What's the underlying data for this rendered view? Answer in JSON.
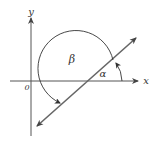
{
  "diagram": {
    "axis_labels": {
      "x": "x",
      "y": "y",
      "origin": "0"
    },
    "angle_labels": {
      "alpha": "α",
      "beta": "β"
    },
    "colors": {
      "axes": "#555555",
      "line": "#666666",
      "arc": "#333333",
      "text": "#333333"
    }
  }
}
